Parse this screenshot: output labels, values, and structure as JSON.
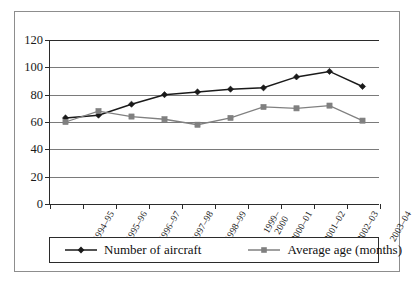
{
  "figure": {
    "cut_title_fragment": "",
    "frame_color": "#8d8d8d"
  },
  "chart_data": {
    "type": "line",
    "title": "",
    "subtitle": "",
    "xlabel": "",
    "ylabel": "",
    "ylim": [
      0,
      120
    ],
    "ytick_step": 20,
    "yticks": [
      "0",
      "20",
      "40",
      "60",
      "80",
      "100",
      "120"
    ],
    "grid": "horizontal",
    "legend_position": "bottom",
    "categories": [
      "1994–95",
      "1995–96",
      "1996–97",
      "1997–98",
      "1998–99",
      "1999–2000",
      "2000–01",
      "2001–02",
      "2002–03",
      "2003–04"
    ],
    "series": [
      {
        "name": "Number of aircraft",
        "color": "#1a1a1a",
        "marker": "diamond",
        "values": [
          63,
          65,
          73,
          80,
          82,
          84,
          85,
          93,
          97,
          86
        ]
      },
      {
        "name": "Average age (months)",
        "color": "#808080",
        "marker": "square",
        "values": [
          60,
          68,
          64,
          62,
          58,
          63,
          71,
          70,
          72,
          61
        ]
      }
    ]
  },
  "legend": {
    "items": [
      {
        "label": "Number of aircraft"
      },
      {
        "label": "Average age (months)"
      }
    ]
  }
}
